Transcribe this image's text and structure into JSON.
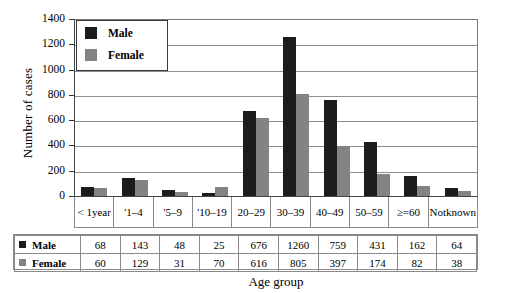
{
  "chart_data": {
    "type": "bar",
    "title": "",
    "xlabel": "Age group",
    "ylabel": "Number of cases",
    "ylim": [
      0,
      1400
    ],
    "y_ticks": [
      0,
      200,
      400,
      600,
      800,
      1000,
      1200,
      1400
    ],
    "grid": true,
    "legend_position": "top-left-inside",
    "categories": [
      "< 1 year",
      "'1–4",
      "'5–9",
      "'10–19",
      "20–29",
      "30–39",
      "40–49",
      "50–59",
      "≥=60",
      "Not known"
    ],
    "category_lines": [
      [
        "< 1",
        "year"
      ],
      [
        "'1–4"
      ],
      [
        "'5–9"
      ],
      [
        "'10–19"
      ],
      [
        "20–29"
      ],
      [
        "30–39"
      ],
      [
        "40–49"
      ],
      [
        "50–59"
      ],
      [
        "≥=60"
      ],
      [
        "Not",
        "known"
      ]
    ],
    "series": [
      {
        "name": "Male",
        "color": "#1c1c1c",
        "values": [
          68,
          143,
          48,
          25,
          676,
          1260,
          759,
          431,
          162,
          64
        ]
      },
      {
        "name": "Female",
        "color": "#838383",
        "values": [
          60,
          129,
          31,
          70,
          616,
          805,
          397,
          174,
          82,
          38
        ]
      }
    ]
  },
  "legend": {
    "items": [
      {
        "label": "Male"
      },
      {
        "label": "Female"
      }
    ]
  },
  "table": {
    "rows": [
      {
        "label": "Male",
        "values": [
          "68",
          "143",
          "48",
          "25",
          "676",
          "1260",
          "759",
          "431",
          "162",
          "64"
        ]
      },
      {
        "label": "Female",
        "values": [
          "60",
          "129",
          "31",
          "70",
          "616",
          "805",
          "397",
          "174",
          "82",
          "38"
        ]
      }
    ]
  },
  "axis": {
    "y_title": "Number of cases",
    "x_title": "Age group",
    "y_tick_labels": [
      "1400",
      "1200",
      "1000",
      "800",
      "600",
      "400",
      "200",
      "0"
    ]
  },
  "colors": {
    "male": "#1c1c1c",
    "female": "#838383",
    "grid": "#8d8d8d",
    "frame": "#7a7a7a",
    "background": "#ffffff"
  }
}
